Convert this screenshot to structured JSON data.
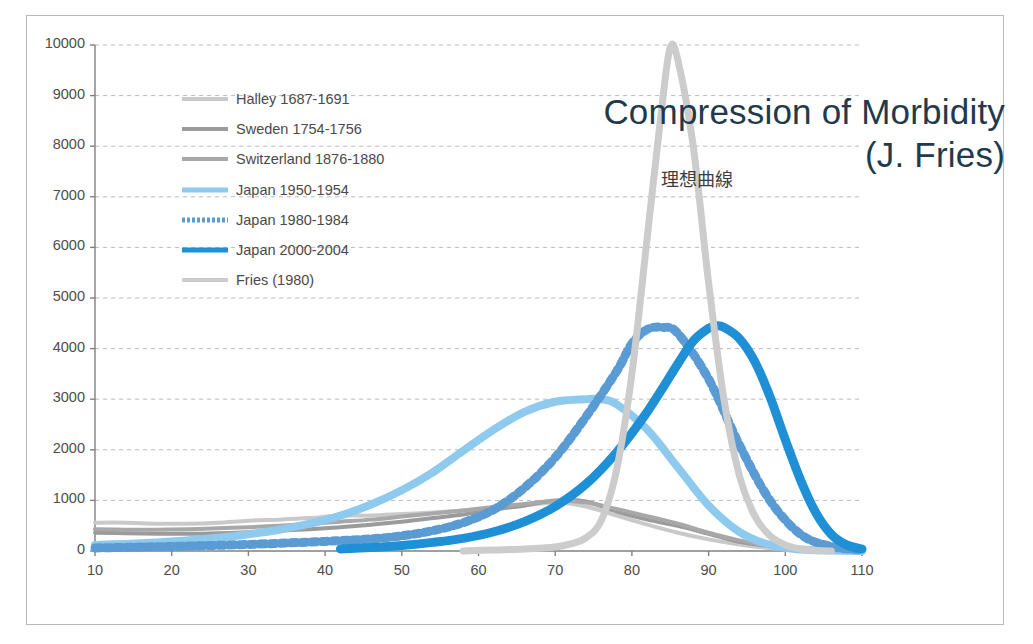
{
  "slide": {
    "title_line1": "Compression of Morbidity",
    "title_line2": "(J. Fries)",
    "title_color": "#1f3a4d",
    "annotation": "理想曲線",
    "background": "#ffffff",
    "frame_color": "#b9b9b9"
  },
  "chart_data": {
    "type": "line",
    "title": "Compression of Morbidity (J. Fries)",
    "xlabel": "",
    "ylabel": "",
    "xlim": [
      10,
      110
    ],
    "ylim": [
      0,
      10000
    ],
    "xticks": [
      10,
      20,
      30,
      40,
      50,
      60,
      70,
      80,
      90,
      100,
      110
    ],
    "yticks": [
      0,
      1000,
      2000,
      3000,
      4000,
      5000,
      6000,
      7000,
      8000,
      9000,
      10000
    ],
    "grid": "horizontal-dashed",
    "legend_position": "upper-left-inside",
    "annotations": [
      {
        "text": "理想曲線",
        "x": 85,
        "y": 7800
      }
    ],
    "series": [
      {
        "name": "Halley 1687-1691",
        "label": "Halley  1687-1691",
        "color": "#c9c9c9",
        "width": 4,
        "style": "solid",
        "x": [
          10,
          14,
          18,
          22,
          26,
          30,
          34,
          38,
          42,
          46,
          50,
          54,
          58,
          62,
          66,
          70,
          74,
          78,
          82,
          86,
          90,
          94,
          98,
          102,
          106,
          110
        ],
        "values": [
          560,
          560,
          540,
          540,
          560,
          600,
          620,
          650,
          700,
          700,
          730,
          760,
          800,
          850,
          900,
          960,
          880,
          700,
          520,
          360,
          230,
          130,
          60,
          20,
          5,
          0
        ]
      },
      {
        "name": "Sweden 1754-1756",
        "label": "Sweden 1754-1756",
        "color": "#9b9b9b",
        "width": 4,
        "style": "solid",
        "x": [
          10,
          14,
          18,
          22,
          26,
          30,
          34,
          38,
          42,
          46,
          50,
          54,
          58,
          62,
          66,
          70,
          74,
          78,
          82,
          86,
          90,
          94,
          98,
          102,
          106,
          110
        ],
        "values": [
          360,
          350,
          340,
          340,
          350,
          370,
          400,
          430,
          470,
          520,
          580,
          650,
          720,
          820,
          900,
          1000,
          980,
          780,
          620,
          500,
          340,
          180,
          100,
          40,
          10,
          0
        ]
      },
      {
        "name": "Switzerland 1876-1880",
        "label": "Switzerland  1876-1880",
        "color": "#a8a8a8",
        "width": 4,
        "style": "solid",
        "x": [
          10,
          14,
          18,
          22,
          26,
          30,
          34,
          38,
          42,
          46,
          50,
          54,
          58,
          62,
          66,
          70,
          74,
          78,
          82,
          86,
          90,
          94,
          98,
          102,
          106,
          110
        ],
        "values": [
          430,
          420,
          420,
          430,
          450,
          470,
          500,
          540,
          580,
          620,
          680,
          740,
          800,
          870,
          930,
          990,
          960,
          830,
          690,
          540,
          360,
          210,
          110,
          40,
          10,
          0
        ]
      },
      {
        "name": "Japan 1950-1954",
        "label": "Japan 1950-1954",
        "color": "#8ec9ee",
        "width": 8,
        "style": "solid",
        "x": [
          10,
          14,
          18,
          22,
          26,
          30,
          34,
          38,
          42,
          46,
          50,
          54,
          58,
          62,
          66,
          70,
          74,
          76,
          78,
          82,
          86,
          90,
          94,
          98,
          102,
          106,
          110
        ],
        "values": [
          120,
          140,
          170,
          210,
          260,
          330,
          420,
          540,
          700,
          920,
          1200,
          1550,
          1980,
          2400,
          2750,
          2950,
          3000,
          3000,
          2900,
          2400,
          1650,
          900,
          380,
          120,
          30,
          10,
          0
        ]
      },
      {
        "name": "Japan 1980-1984",
        "label": "Japan 1980-1984",
        "color": "#5a9bd4",
        "width": 9,
        "style": "dotted",
        "x": [
          10,
          20,
          30,
          40,
          46,
          50,
          54,
          58,
          62,
          66,
          70,
          74,
          78,
          80,
          82,
          84,
          86,
          90,
          94,
          98,
          102,
          106,
          110
        ],
        "values": [
          60,
          90,
          130,
          190,
          240,
          300,
          400,
          560,
          820,
          1250,
          1850,
          2650,
          3550,
          4100,
          4380,
          4420,
          4300,
          3400,
          2100,
          1000,
          330,
          90,
          20
        ]
      },
      {
        "name": "Japan 2000-2004",
        "label": "Japan 2000-2004",
        "color": "#1f8fd6",
        "width": 9,
        "style": "solid",
        "x": [
          42,
          46,
          50,
          54,
          58,
          62,
          66,
          70,
          74,
          78,
          82,
          86,
          88,
          90,
          91,
          92,
          94,
          96,
          98,
          100,
          102,
          104,
          106,
          108,
          110
        ],
        "values": [
          40,
          70,
          110,
          170,
          250,
          380,
          580,
          880,
          1320,
          1950,
          2750,
          3700,
          4150,
          4400,
          4450,
          4420,
          4200,
          3750,
          3050,
          2200,
          1400,
          750,
          330,
          120,
          40
        ]
      },
      {
        "name": "Fries (1980)",
        "label": "Fries (1980)",
        "color": "#cccccc",
        "width": 7,
        "style": "solid",
        "x": [
          58,
          62,
          66,
          70,
          72,
          74,
          76,
          78,
          80,
          82,
          84,
          85,
          86,
          88,
          90,
          92,
          94,
          96,
          98,
          100,
          102,
          104,
          106
        ],
        "values": [
          0,
          20,
          40,
          80,
          140,
          260,
          600,
          1600,
          3500,
          6200,
          8900,
          9950,
          9700,
          8000,
          5300,
          3000,
          1500,
          700,
          300,
          120,
          40,
          10,
          0
        ]
      }
    ]
  },
  "legend": {
    "items": [
      {
        "label": "Halley  1687-1691",
        "color": "#c9c9c9",
        "style": "solid",
        "thickness": 4
      },
      {
        "label": "Sweden 1754-1756",
        "color": "#9b9b9b",
        "style": "solid",
        "thickness": 4
      },
      {
        "label": "Switzerland  1876-1880",
        "color": "#a8a8a8",
        "style": "solid",
        "thickness": 4
      },
      {
        "label": "Japan 1950-1954",
        "color": "#8ec9ee",
        "style": "solid",
        "thickness": 5
      },
      {
        "label": "Japan 1980-1984",
        "color": "#5a9bd4",
        "style": "dotted",
        "thickness": 5
      },
      {
        "label": "Japan 2000-2004",
        "color": "#1f8fd6",
        "style": "solid",
        "thickness": 5
      },
      {
        "label": "Fries (1980)",
        "color": "#cccccc",
        "style": "solid",
        "thickness": 4
      }
    ]
  },
  "axes": {
    "y_tick_labels": [
      "10000",
      "9000",
      "8000",
      "7000",
      "6000",
      "5000",
      "4000",
      "3000",
      "2000",
      "1000",
      "0"
    ],
    "x_tick_labels": [
      "10",
      "20",
      "30",
      "40",
      "50",
      "60",
      "70",
      "80",
      "90",
      "100",
      "110"
    ],
    "axis_color": "#808080",
    "grid_color": "#9aa7b5",
    "tick_text_color": "#4d4d4d"
  }
}
